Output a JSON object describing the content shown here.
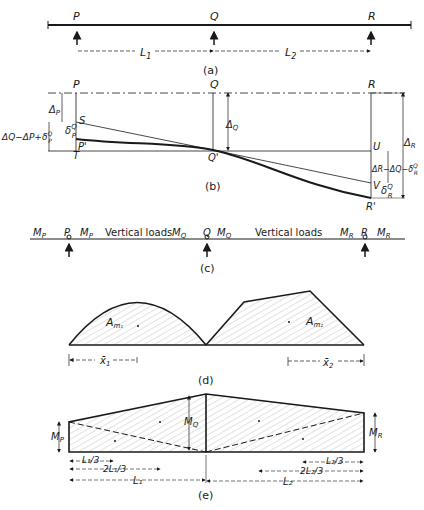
{
  "figure": {
    "panels": [
      {
        "id": "a",
        "caption": "(a)",
        "supports": [
          "P",
          "Q",
          "R"
        ],
        "spans": [
          "L1",
          "L2"
        ]
      },
      {
        "id": "b",
        "caption": "(b)",
        "points": [
          "P",
          "Q",
          "R",
          "S",
          "P'",
          "T",
          "Q'",
          "U",
          "V",
          "R'"
        ],
        "dimensions": [
          "ΔP",
          "δPQ",
          "ΔQ−ΔP+δPQ",
          "ΔQ",
          "ΔR",
          "ΔR−ΔQ−δRQ",
          "δRQ"
        ]
      },
      {
        "id": "c",
        "caption": "(c)",
        "moments": [
          "MP",
          "MP",
          "MQ",
          "MQ",
          "MR",
          "MR"
        ],
        "loads": [
          "Vertical loads",
          "Vertical loads"
        ]
      },
      {
        "id": "d",
        "caption": "(d)",
        "areas": [
          "Am1",
          "Am2"
        ],
        "centroids": [
          "x̄1",
          "x̄2"
        ]
      },
      {
        "id": "e",
        "caption": "(e)",
        "moments": [
          "MP",
          "MQ",
          "MR"
        ],
        "dims_left": [
          "L1/3",
          "2L1/3",
          "L1"
        ],
        "dims_right": [
          "L2/3",
          "2L2/3",
          "L2"
        ]
      }
    ]
  },
  "labels": {
    "a": {
      "P": "P",
      "Q": "Q",
      "R": "R",
      "L1": "L",
      "L1sub": "1",
      "L2": "L",
      "L2sub": "2",
      "caption": "(a)"
    },
    "b": {
      "P": "P",
      "Q": "Q",
      "R": "R",
      "S": "S",
      "Pp": "P'",
      "T": "T",
      "Qp": "Q'",
      "U": "U",
      "V": "V",
      "Rp": "R'",
      "dP": "Δ",
      "dPsub": "P",
      "deltaPQ": "δ",
      "deltaPQsup": "Q",
      "deltaPQsub": "P",
      "combo": "ΔQ−ΔP+δ",
      "comboSup": "Q",
      "comboSub": "P",
      "dQ": "Δ",
      "dQsub": "Q",
      "dR": "Δ",
      "dRsub": "R",
      "combo2": "ΔR−ΔQ−δ",
      "combo2Sup": "Q",
      "combo2Sub": "R",
      "deltaRQ": "δ",
      "deltaRQsup": "Q",
      "deltaRQsub": "R",
      "caption": "(b)"
    },
    "c": {
      "MP": "M",
      "MPsub": "P",
      "MQ": "M",
      "MQsub": "Q",
      "MR": "M",
      "MRsub": "R",
      "P": "P",
      "Q": "Q",
      "R": "R",
      "load1": "Vertical loads",
      "load2": "Vertical loads",
      "caption": "(c)"
    },
    "d": {
      "Am1": "A",
      "Am1sub": "m₁",
      "Am2": "A",
      "Am2sub": "m₂",
      "x1": "x̄",
      "x1sub": "1",
      "x2": "x̄",
      "x2sub": "2",
      "caption": "(d)"
    },
    "e": {
      "MP": "M",
      "MPsub": "P",
      "MQ": "M",
      "MQsub": "Q",
      "MR": "M",
      "MRsub": "R",
      "L13": "L₁/3",
      "L123": "2L₁/3",
      "L1": "L₁",
      "L23": "L₂/3",
      "L223": "2L₂/3",
      "L2": "L₂",
      "caption": "(e)"
    }
  }
}
